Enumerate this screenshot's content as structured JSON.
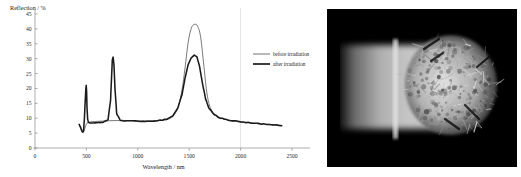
{
  "figure": {
    "chart_data": {
      "type": "line",
      "title": "",
      "xlabel": "Wavelength / nm",
      "ylabel": "Reflection / %",
      "xlim": [
        0,
        2500
      ],
      "ylim": [
        0,
        45
      ],
      "xticks": [
        0,
        500,
        1000,
        1500,
        2000,
        2500
      ],
      "yticks": [
        0,
        5,
        10,
        15,
        20,
        25,
        30,
        35,
        40,
        45
      ],
      "grid": "vertical-gridline-at-2000",
      "legend_position": "right-outside",
      "series": [
        {
          "name": "before irradiation",
          "style": "thin",
          "color": "#262626",
          "x": [
            430,
            445,
            455,
            465,
            475,
            485,
            495,
            505,
            520,
            545,
            580,
            640,
            700,
            760,
            820,
            900,
            1000,
            1100,
            1200,
            1280,
            1340,
            1390,
            1430,
            1460,
            1490,
            1520,
            1550,
            1580,
            1610,
            1640,
            1670,
            1700,
            1740,
            1790,
            1850,
            1920,
            2000,
            2100,
            2200,
            2300,
            2400
          ],
          "y": [
            7.8,
            6.6,
            5.6,
            5.2,
            5.6,
            6.6,
            7.6,
            8.3,
            8.6,
            8.8,
            8.9,
            9.0,
            9.1,
            9.2,
            9.2,
            9.2,
            9.1,
            9.1,
            9.2,
            9.5,
            10.6,
            13.5,
            19.5,
            27.0,
            35.5,
            40.2,
            41.5,
            41.0,
            37.5,
            28.5,
            19.0,
            14.0,
            11.6,
            10.4,
            9.6,
            9.1,
            8.7,
            8.4,
            8.1,
            7.9,
            7.6
          ]
        },
        {
          "name": "after irradiation",
          "style": "thick",
          "color": "#1a1a1a",
          "x": [
            430,
            445,
            455,
            465,
            472,
            480,
            488,
            494,
            498,
            502,
            506,
            512,
            520,
            535,
            560,
            600,
            660,
            710,
            735,
            745,
            752,
            760,
            768,
            778,
            795,
            830,
            900,
            1000,
            1100,
            1200,
            1280,
            1340,
            1390,
            1430,
            1460,
            1490,
            1520,
            1550,
            1575,
            1600,
            1630,
            1660,
            1690,
            1730,
            1780,
            1840,
            1910,
            2000,
            2100,
            2200,
            2300,
            2400
          ],
          "y": [
            7.9,
            6.8,
            5.8,
            5.3,
            5.8,
            9.5,
            15.5,
            19.5,
            21.0,
            19.0,
            13.5,
            9.8,
            8.6,
            8.4,
            8.4,
            8.5,
            8.6,
            9.5,
            16.0,
            24.0,
            29.5,
            30.5,
            28.0,
            20.0,
            11.5,
            9.3,
            9.1,
            9.0,
            9.0,
            9.2,
            9.6,
            10.8,
            13.5,
            18.0,
            23.5,
            28.0,
            30.3,
            31.2,
            30.6,
            27.5,
            21.5,
            16.5,
            13.5,
            11.6,
            10.4,
            9.7,
            9.2,
            8.8,
            8.4,
            8.1,
            7.9,
            7.5
          ]
        }
      ],
      "legend": [
        "before irradiation",
        "after irradiation"
      ]
    },
    "photo": {
      "alt": "dark-field micrograph of irradiated specimen"
    }
  },
  "colors": {
    "axis": "#8a8a8a",
    "gridline": "#cfcfcf",
    "text": "#1a1a1a",
    "photo_background": "#000000"
  }
}
